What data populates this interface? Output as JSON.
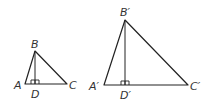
{
  "diagram": {
    "stroke_color": "#222222",
    "label_color": "#333333",
    "small_triangle": {
      "vertices": {
        "A": {
          "label": "A",
          "x": 25,
          "y": 84
        },
        "B": {
          "label": "B",
          "x": 35,
          "y": 51
        },
        "C": {
          "label": "C",
          "x": 67,
          "y": 84
        },
        "D": {
          "label": "D",
          "x": 35,
          "y": 84
        }
      },
      "altitude": "BD",
      "right_angle_at": "D"
    },
    "large_triangle": {
      "vertices": {
        "A": {
          "label": "A′",
          "x": 104,
          "y": 85
        },
        "B": {
          "label": "B′",
          "x": 125,
          "y": 20
        },
        "C": {
          "label": "C′",
          "x": 188,
          "y": 85
        },
        "D": {
          "label": "D′",
          "x": 125,
          "y": 85
        }
      },
      "altitude": "B′D′",
      "right_angle_at": "D′"
    }
  }
}
